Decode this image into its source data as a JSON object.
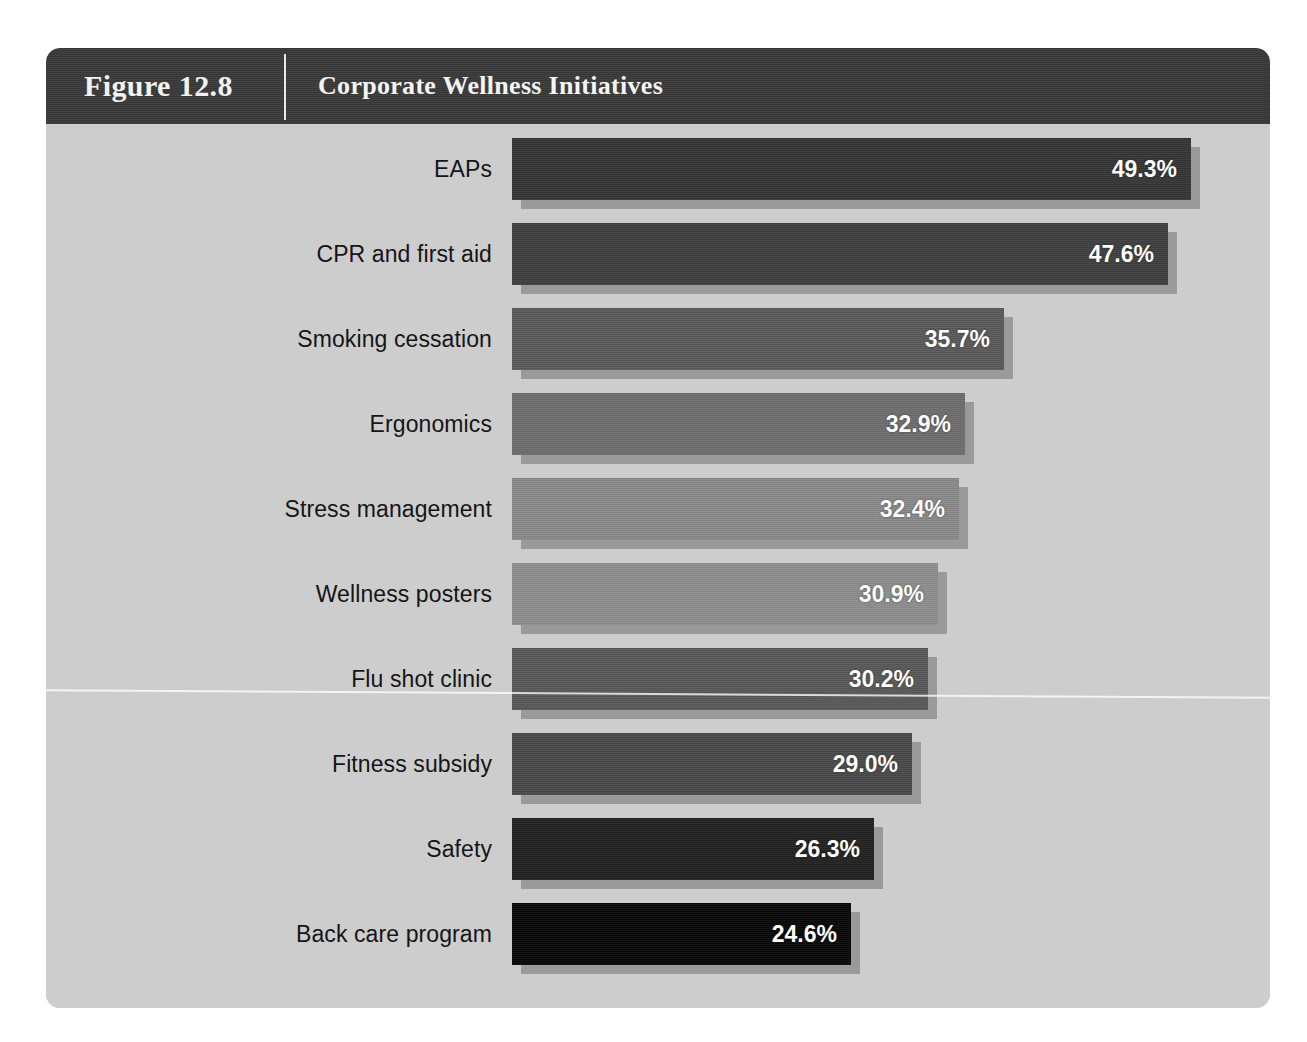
{
  "figure": {
    "number_label": "Figure 12.8",
    "title": "Corporate Wellness Initiatives"
  },
  "chart_data": {
    "type": "bar",
    "orientation": "horizontal",
    "title": "Corporate Wellness Initiatives",
    "xlabel": "",
    "ylabel": "",
    "xlim": [
      0,
      55
    ],
    "grid": false,
    "legend": null,
    "value_suffix": "%",
    "categories": [
      "EAPs",
      "CPR and first aid",
      "Smoking cessation",
      "Ergonomics",
      "Stress management",
      "Wellness posters",
      "Flu shot clinic",
      "Fitness subsidy",
      "Safety",
      "Back care program"
    ],
    "values": [
      49.3,
      47.6,
      35.7,
      32.9,
      32.4,
      30.9,
      30.2,
      29.0,
      26.3,
      24.6
    ],
    "value_labels": [
      "49.3%",
      "47.6%",
      "35.7%",
      "32.9%",
      "32.4%",
      "30.9%",
      "30.2%",
      "29.0%",
      "26.3%",
      "24.6%"
    ],
    "bar_colors": [
      "#363636",
      "#404040",
      "#5a5a5a",
      "#6e6e6e",
      "#8a8a8a",
      "#8e8e8e",
      "#595959",
      "#4a4a4a",
      "#232323",
      "#080808"
    ]
  },
  "colors": {
    "header_band": "#3a3a3a",
    "card_background": "#cdcdcd",
    "page_background": "#ffffff",
    "bar_shadow": "#9a9a9a",
    "label_text": "#151515",
    "value_text": "#ffffff",
    "header_text": "#f2f2f2"
  }
}
